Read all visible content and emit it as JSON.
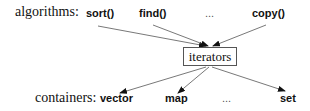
{
  "algorithms": {
    "label": "algorithms:",
    "items": [
      "sort()",
      "find()",
      "...",
      "copy()"
    ]
  },
  "center": {
    "label": "iterators"
  },
  "containers": {
    "label": "containers:",
    "items": [
      "vector",
      "map",
      "...",
      "set"
    ]
  },
  "colors": {
    "line": "#555555",
    "text": "#111111"
  }
}
